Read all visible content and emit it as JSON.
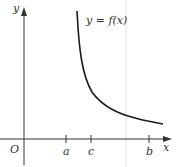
{
  "diagram": {
    "curve_label": "y = f(x)",
    "axes": {
      "x_label": "x",
      "y_label": "y",
      "origin_label": "O"
    },
    "ticks": [
      {
        "label": "a",
        "x": 66
      },
      {
        "label": "c",
        "x": 91
      },
      {
        "label": "b",
        "x": 149
      }
    ],
    "colors": {
      "curve": "#1a1a1a",
      "axis": "#333333",
      "guide": "#e0e0e0"
    }
  }
}
